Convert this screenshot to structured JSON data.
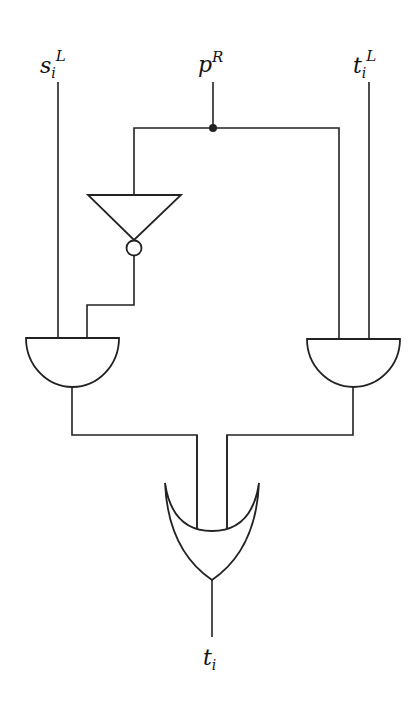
{
  "diagram": {
    "type": "logic-circuit",
    "inputs": [
      {
        "id": "s_i^L",
        "base": "s",
        "sub": "i",
        "sup": "L"
      },
      {
        "id": "p^R",
        "base": "p",
        "sub": "",
        "sup": "R"
      },
      {
        "id": "t_i^L",
        "base": "t",
        "sub": "i",
        "sup": "L"
      }
    ],
    "output": {
      "id": "t_i",
      "base": "t",
      "sub": "i",
      "sup": ""
    },
    "gates": [
      {
        "id": "not1",
        "type": "NOT",
        "input": "p^R"
      },
      {
        "id": "and1",
        "type": "AND",
        "inputs": [
          "s_i^L",
          "not1"
        ]
      },
      {
        "id": "and2",
        "type": "AND",
        "inputs": [
          "p^R",
          "t_i^L"
        ]
      },
      {
        "id": "or1",
        "type": "OR",
        "inputs": [
          "and1",
          "and2"
        ],
        "output": "t_i"
      }
    ],
    "colors": {
      "line": "#222222",
      "background": "#ffffff"
    }
  }
}
